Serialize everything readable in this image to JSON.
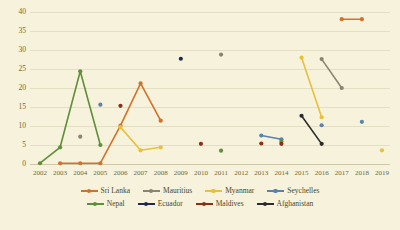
{
  "chart_data": {
    "type": "line",
    "title": "",
    "xlabel": "",
    "ylabel": "",
    "grid": true,
    "legend_position": "bottom",
    "x": [
      2002,
      2003,
      2004,
      2005,
      2006,
      2007,
      2008,
      2009,
      2010,
      2011,
      2012,
      2013,
      2014,
      2015,
      2016,
      2017,
      2018,
      2019
    ],
    "xlim": [
      2002,
      2019
    ],
    "ylim": [
      0,
      40
    ],
    "yticks": [
      0,
      5,
      10,
      15,
      20,
      25,
      30,
      35,
      40
    ],
    "xticks": [
      "2002",
      "2003",
      "2004",
      "2005",
      "2006",
      "2007",
      "2008",
      "2009",
      "2010",
      "2011",
      "2012",
      "2013",
      "2014",
      "2015",
      "2016",
      "2017",
      "2018",
      "2019"
    ],
    "series": [
      {
        "name": "Sri Lanka",
        "color": "#d2722a",
        "points": [
          {
            "x": 2003,
            "y": 0.2
          },
          {
            "x": 2004,
            "y": 0.2
          },
          {
            "x": 2005,
            "y": 0.2
          },
          {
            "x": 2006,
            "y": 10.1
          },
          {
            "x": 2007,
            "y": 21.2
          },
          {
            "x": 2008,
            "y": 11.4
          }
        ],
        "segments": [
          [
            2003,
            2004,
            2005,
            2006,
            2007,
            2008
          ],
          [
            2017,
            2018
          ]
        ],
        "extra_points": [
          {
            "x": 2017,
            "y": 38.1
          },
          {
            "x": 2018,
            "y": 38.1
          }
        ]
      },
      {
        "name": "Mauritius",
        "color": "#8c8471",
        "points": [
          {
            "x": 2004,
            "y": 7.2
          },
          {
            "x": 2011,
            "y": 28.8
          },
          {
            "x": 2016,
            "y": 27.6
          },
          {
            "x": 2017,
            "y": 20.0
          }
        ],
        "segments": [
          [
            2016,
            2017
          ]
        ]
      },
      {
        "name": "Myanmar",
        "color": "#e8c03c",
        "points": [
          {
            "x": 2006,
            "y": 9.7
          },
          {
            "x": 2007,
            "y": 3.6
          },
          {
            "x": 2008,
            "y": 4.4
          },
          {
            "x": 2015,
            "y": 28.0
          },
          {
            "x": 2016,
            "y": 12.3
          },
          {
            "x": 2019,
            "y": 3.6
          }
        ],
        "segments": [
          [
            2006,
            2007,
            2008
          ],
          [
            2015,
            2016
          ]
        ]
      },
      {
        "name": "Seychelles",
        "color": "#5b82ab",
        "points": [
          {
            "x": 2005,
            "y": 15.6
          },
          {
            "x": 2013,
            "y": 7.5
          },
          {
            "x": 2014,
            "y": 6.5
          },
          {
            "x": 2016,
            "y": 10.2
          },
          {
            "x": 2018,
            "y": 11.1
          }
        ],
        "segments": [
          [
            2013,
            2014
          ]
        ]
      },
      {
        "name": "Nepal",
        "color": "#5f8f3a",
        "points": [
          {
            "x": 2002,
            "y": 0.2
          },
          {
            "x": 2003,
            "y": 4.4
          },
          {
            "x": 2004,
            "y": 24.4
          },
          {
            "x": 2005,
            "y": 5.0
          },
          {
            "x": 2011,
            "y": 3.5
          },
          {
            "x": 2014,
            "y": 5.9
          }
        ],
        "segments": [
          [
            2002,
            2003,
            2004,
            2005
          ]
        ]
      },
      {
        "name": "Ecuador",
        "color": "#1f2a4a",
        "points": [
          {
            "x": 2009,
            "y": 27.7
          }
        ],
        "segments": []
      },
      {
        "name": "Maldives",
        "color": "#8c2f16",
        "points": [
          {
            "x": 2006,
            "y": 15.3
          },
          {
            "x": 2010,
            "y": 5.3
          },
          {
            "x": 2013,
            "y": 5.4
          },
          {
            "x": 2014,
            "y": 5.3
          }
        ],
        "segments": []
      },
      {
        "name": "Afghanistan",
        "color": "#2b2b2b",
        "points": [
          {
            "x": 2015,
            "y": 12.7
          },
          {
            "x": 2016,
            "y": 5.3
          }
        ],
        "segments": [
          [
            2015,
            2016
          ]
        ]
      }
    ]
  },
  "legend": {
    "rows": [
      [
        {
          "label": "Sri Lanka",
          "color": "#d2722a"
        },
        {
          "label": "Mauritius",
          "color": "#8c8471"
        },
        {
          "label": "Myanmar",
          "color": "#e8c03c"
        },
        {
          "label": "Seychelles",
          "color": "#5b82ab"
        }
      ],
      [
        {
          "label": "Nepal",
          "color": "#5f8f3a"
        },
        {
          "label": "Ecuador",
          "color": "#1f2a4a"
        },
        {
          "label": "Maldives",
          "color": "#8c2f16"
        },
        {
          "label": "Afghanistan",
          "color": "#2b2b2b"
        }
      ]
    ]
  },
  "colors": {
    "background": "#f7f2dc",
    "gridline": "#e4dec4",
    "tick_text": "#6b6a3f",
    "legend_text": "#4a4828"
  }
}
